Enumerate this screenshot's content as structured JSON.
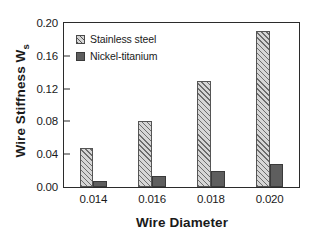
{
  "chart_data": {
    "type": "bar",
    "title": "",
    "subtitle": "",
    "xlabel": "Wire Diameter",
    "ylabel": "Wire Stiffness W",
    "ylabel_subscript": "s",
    "categories": [
      "0.014",
      "0.016",
      "0.018",
      "0.020"
    ],
    "series": [
      {
        "name": "Stainless steel",
        "values": [
          0.047,
          0.08,
          0.129,
          0.19
        ],
        "fill": "diagonal-hatch",
        "color": "#d6d6d6"
      },
      {
        "name": "Nickel-titanium",
        "values": [
          0.007,
          0.014,
          0.02,
          0.028
        ],
        "fill": "solid",
        "color": "#5e5e5e"
      }
    ],
    "ylim": [
      0.0,
      0.2
    ],
    "yticks": [
      "0.00",
      "0.04",
      "0.08",
      "0.12",
      "0.16",
      "0.20"
    ],
    "ytick_values": [
      0.0,
      0.04,
      0.08,
      0.12,
      0.16,
      0.2
    ],
    "xticks": [
      "0.014",
      "0.016",
      "0.018",
      "0.020"
    ],
    "grid": false,
    "legend_position": "top-left-inside",
    "frame": true,
    "axis_color": "#2b2b2b",
    "background": "#ffffff"
  }
}
